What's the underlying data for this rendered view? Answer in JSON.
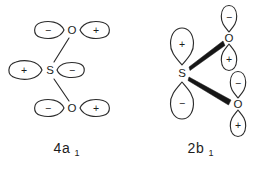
{
  "figure": {
    "background_color": "#ffffff",
    "line_color": "#2b2b2b",
    "wedge_color": "#161616",
    "text_color": "#1d1d1d"
  },
  "diagrams": [
    {
      "id": "mo-4a1",
      "caption_main": "4a",
      "caption_sub": "1",
      "caption_full": "4a1",
      "bond_style": "thin-line",
      "atoms": [
        {
          "id": "o-top",
          "label": "O",
          "x": 72,
          "y": 30
        },
        {
          "id": "s-center",
          "label": "S",
          "x": 50,
          "y": 70
        },
        {
          "id": "o-bottom",
          "label": "O",
          "x": 72,
          "y": 108
        }
      ],
      "lobes": [
        {
          "id": "o-top-left",
          "sign": "−",
          "atom": "o-top",
          "orientation": "horizontal-left",
          "cx": 50,
          "cy": 30,
          "rx": 17,
          "ry": 8.5
        },
        {
          "id": "o-top-right",
          "sign": "+",
          "atom": "o-top",
          "orientation": "horizontal-right",
          "cx": 95,
          "cy": 30,
          "rx": 17,
          "ry": 8.5
        },
        {
          "id": "s-left",
          "sign": "+",
          "atom": "s-center",
          "orientation": "horizontal-left",
          "cx": 26,
          "cy": 70,
          "rx": 17,
          "ry": 9.5
        },
        {
          "id": "s-right",
          "sign": "−",
          "atom": "s-center",
          "orientation": "horizontal-right",
          "cx": 70,
          "cy": 70,
          "rx": 14,
          "ry": 8.0
        },
        {
          "id": "o-bottom-left",
          "sign": "−",
          "atom": "o-bottom",
          "orientation": "horizontal-left",
          "cx": 50,
          "cy": 108,
          "rx": 17,
          "ry": 8.5
        },
        {
          "id": "o-bottom-right",
          "sign": "+",
          "atom": "o-bottom",
          "orientation": "horizontal-right",
          "cx": 95,
          "cy": 108,
          "rx": 17,
          "ry": 8.5
        }
      ],
      "bonds": [
        {
          "id": "bond-s-o-top",
          "from": "s-center",
          "to": "o-top"
        },
        {
          "id": "bond-s-o-bottom",
          "from": "s-center",
          "to": "o-bottom"
        }
      ]
    },
    {
      "id": "mo-2b1",
      "caption_main": "2b",
      "caption_sub": "1",
      "caption_full": "2b1",
      "bond_style": "thick-wedge",
      "atoms": [
        {
          "id": "s-center",
          "label": "S",
          "x": 182,
          "y": 73
        },
        {
          "id": "o-top",
          "label": "O",
          "x": 229,
          "y": 38
        },
        {
          "id": "o-bottom",
          "label": "O",
          "x": 238,
          "y": 104
        }
      ],
      "lobes": [
        {
          "id": "s-up",
          "sign": "+",
          "atom": "s-center",
          "orientation": "vertical-up",
          "cx": 182,
          "cy": 48,
          "rx": 12,
          "ry": 19
        },
        {
          "id": "s-down",
          "sign": "−",
          "atom": "s-center",
          "orientation": "vertical-down",
          "cx": 182,
          "cy": 99,
          "rx": 12,
          "ry": 19
        },
        {
          "id": "o-top-up",
          "sign": "−",
          "atom": "o-top",
          "orientation": "vertical-up",
          "cx": 229,
          "cy": 20,
          "rx": 9,
          "ry": 14
        },
        {
          "id": "o-top-down",
          "sign": "+",
          "atom": "o-top",
          "orientation": "vertical-down",
          "cx": 229,
          "cy": 57,
          "rx": 9,
          "ry": 14
        },
        {
          "id": "o-bottom-up",
          "sign": "−",
          "atom": "o-bottom",
          "orientation": "vertical-up",
          "cx": 238,
          "cy": 86,
          "rx": 9,
          "ry": 14
        },
        {
          "id": "o-bottom-down",
          "sign": "+",
          "atom": "o-bottom",
          "orientation": "vertical-down",
          "cx": 238,
          "cy": 123,
          "rx": 9,
          "ry": 14
        }
      ],
      "bonds": [
        {
          "id": "bond-s-o-top",
          "from": "s-center",
          "to": "o-top"
        },
        {
          "id": "bond-s-o-bottom",
          "from": "s-center",
          "to": "o-bottom"
        }
      ]
    }
  ],
  "captions": [
    {
      "id": "caption-4a1",
      "main": "4a",
      "sub": "1",
      "x": 62,
      "y": 148
    },
    {
      "id": "caption-2b1",
      "main": "2b",
      "sub": "1",
      "x": 196,
      "y": 148
    }
  ]
}
